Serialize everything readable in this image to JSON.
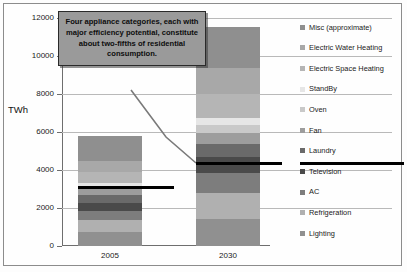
{
  "axis": {
    "y_title": "TWh",
    "y_ticks": [
      0,
      2000,
      4000,
      6000,
      8000,
      10000,
      12000
    ],
    "x_categories": [
      "2005",
      "2030"
    ]
  },
  "callout": {
    "text": "Four appliance categories, each with major efficiency potential, constitute about two-fifths of residential consumption."
  },
  "legend": {
    "items": [
      {
        "label": "Misc (approximate)",
        "color": "#8f8f8f"
      },
      {
        "label": "Electric Water Heating",
        "color": "#a8a8a8"
      },
      {
        "label": "Electric Space Heating",
        "color": "#b5b5b5"
      },
      {
        "label": "StandBy",
        "color": "#e6e6e6"
      },
      {
        "label": "Oven",
        "color": "#c9c9c9"
      },
      {
        "label": "Fan",
        "color": "#9d9d9d"
      },
      {
        "label": "Laundry",
        "color": "#6a6a6a"
      },
      {
        "label": "Television",
        "color": "#4a4a4a"
      },
      {
        "label": "AC",
        "color": "#7d7d7d"
      },
      {
        "label": "Refrigeration",
        "color": "#b0b0b0"
      },
      {
        "label": "Lighting",
        "color": "#909090"
      }
    ]
  },
  "chart_data": {
    "type": "bar",
    "title": "",
    "subtitle": "",
    "xlabel": "",
    "ylabel": "TWh",
    "ylim": [
      0,
      12000
    ],
    "grid": true,
    "stacked": true,
    "legend_position": "right",
    "categories": [
      "2005",
      "2030"
    ],
    "series": [
      {
        "name": "Lighting",
        "color": "#909090",
        "values": [
          720,
          1430
        ]
      },
      {
        "name": "Refrigeration",
        "color": "#b0b0b0",
        "values": [
          660,
          1380
        ]
      },
      {
        "name": "AC",
        "color": "#7d7d7d",
        "values": [
          480,
          1020
        ]
      },
      {
        "name": "Television",
        "color": "#4a4a4a",
        "values": [
          430,
          830
        ]
      },
      {
        "name": "Laundry",
        "color": "#6a6a6a",
        "values": [
          390,
          720
        ]
      },
      {
        "name": "Fan",
        "color": "#9d9d9d",
        "values": [
          300,
          560
        ]
      },
      {
        "name": "Oven",
        "color": "#c9c9c9",
        "values": [
          190,
          420
        ]
      },
      {
        "name": "StandBy",
        "color": "#e6e6e6",
        "values": [
          160,
          400
        ]
      },
      {
        "name": "Electric Space Heating",
        "color": "#b5b5b5",
        "values": [
          560,
          1260
        ]
      },
      {
        "name": "Electric Water Heating",
        "color": "#a8a8a8",
        "values": [
          590,
          1330
        ]
      },
      {
        "name": "Misc (approximate)",
        "color": "#8f8f8f",
        "values": [
          1320,
          2200
        ]
      }
    ],
    "totals": [
      5800,
      11550
    ],
    "annotations": [
      {
        "name": "two-fifths-line-2005",
        "value": 2100,
        "span": "2005",
        "style": "black horizontal line"
      },
      {
        "name": "two-fifths-line-2030",
        "value": 4950,
        "span": "2030 extended right",
        "style": "black horizontal line"
      }
    ]
  }
}
